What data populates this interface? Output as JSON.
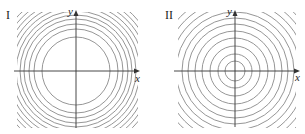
{
  "figure": {
    "panels": [
      {
        "id": "I",
        "label": "I",
        "x_axis_label": "x",
        "y_axis_label": "y",
        "center": [
          76,
          71
        ],
        "clip": [
          17,
          12,
          121,
          116
        ],
        "axis_x": [
          14,
          140
        ],
        "axis_y": [
          10,
          128
        ],
        "radii": [
          34,
          42,
          47,
          52,
          56,
          60,
          64,
          68,
          72,
          76,
          80
        ],
        "description": "Concentric circular contour lines; spacing decreases as distance from origin increases"
      },
      {
        "id": "II",
        "label": "II",
        "x_axis_label": "x",
        "y_axis_label": "y",
        "center": [
          235,
          71
        ],
        "clip": [
          178,
          12,
          118,
          116
        ],
        "axis_x": [
          174,
          300
        ],
        "axis_y": [
          10,
          127
        ],
        "radii": [
          10,
          17,
          25,
          33,
          40,
          47,
          53,
          59,
          65,
          71,
          77,
          83
        ],
        "description": "Concentric circular contour lines; roughly equally spaced from origin outward"
      }
    ],
    "colors": {
      "contour": "#8a8a8a",
      "axis": "#333333",
      "background": "#ffffff"
    }
  }
}
